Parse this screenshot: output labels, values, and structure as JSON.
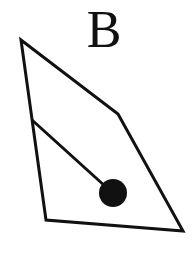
{
  "figure": {
    "label": "B",
    "colors": {
      "stroke": "#111111",
      "fill": "#111111",
      "background": "#ffffff"
    },
    "shape": {
      "type": "quadrilateral",
      "points": [
        [
          21,
          40
        ],
        [
          118,
          114
        ],
        [
          183,
          231
        ],
        [
          46,
          220
        ]
      ]
    },
    "rod": {
      "x1": 32,
      "y1": 120,
      "x2": 106,
      "y2": 187
    },
    "ball": {
      "cx": 113,
      "cy": 193,
      "r": 14
    }
  }
}
